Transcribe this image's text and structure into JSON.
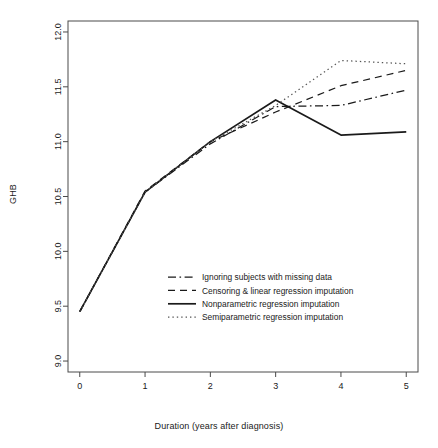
{
  "chart_data": {
    "type": "line",
    "title": "",
    "xlabel": "Duration (years after diagnosis)",
    "ylabel": "GHB",
    "x": [
      0,
      1,
      2,
      3,
      4,
      5
    ],
    "xlim": [
      -0.18,
      5.18
    ],
    "ylim": [
      8.9,
      12.1
    ],
    "xticks": [
      "0",
      "1",
      "2",
      "3",
      "4",
      "5"
    ],
    "yticks": [
      "9.0",
      "9.5",
      "10.0",
      "10.5",
      "11.0",
      "11.5",
      "12.0"
    ],
    "ytick_values": [
      9.0,
      9.5,
      10.0,
      10.5,
      11.0,
      11.5,
      12.0
    ],
    "grid": false,
    "legend_position": "center",
    "series": [
      {
        "name": "Ignoring subjects with missing data",
        "style": "dashdot",
        "color": "#1a1a1a",
        "values": [
          9.45,
          10.54,
          10.98,
          11.32,
          11.33,
          11.47
        ]
      },
      {
        "name": "Censoring & linear regression imputation",
        "style": "dashed",
        "color": "#1a1a1a",
        "values": [
          9.45,
          10.55,
          11.0,
          11.27,
          11.51,
          11.65
        ]
      },
      {
        "name": "Nonparametric regression imputation",
        "style": "solid",
        "color": "#1a1a1a",
        "values": [
          9.45,
          10.54,
          11.0,
          11.38,
          11.06,
          11.09
        ]
      },
      {
        "name": "Semiparametric regression imputation",
        "style": "dotted",
        "color": "#555555",
        "values": [
          9.45,
          10.54,
          11.0,
          11.33,
          11.74,
          11.71
        ]
      }
    ]
  },
  "axes": {
    "frame_color": "#4a4a4a"
  }
}
